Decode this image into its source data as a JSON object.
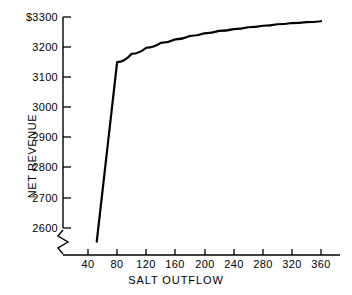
{
  "chart_data": {
    "type": "line",
    "title": "",
    "xlabel": "SALT OUTFLOW",
    "ylabel": "NET REVENUE",
    "xlim": [
      0,
      400
    ],
    "ylim": [
      2550,
      3320
    ],
    "grid": false,
    "legend": "none",
    "y_axis_break": true,
    "y_axis_break_note": "axis broken below 2600",
    "y_currency_prefix": "$",
    "xticks": [
      40,
      80,
      120,
      160,
      200,
      240,
      280,
      320,
      360
    ],
    "xtick_labels": [
      "40",
      "80",
      "120",
      "160",
      "200",
      "240",
      "280",
      "320",
      "360"
    ],
    "yticks": [
      2600,
      2700,
      2800,
      2900,
      3000,
      3100,
      3200,
      3300
    ],
    "ytick_labels": [
      "2600",
      "2700",
      "2800",
      "2900",
      "3000",
      "3100",
      "3200",
      "$3300"
    ],
    "series": [
      {
        "name": "net revenue vs salt outflow",
        "x": [
          52,
          80,
          100,
          120,
          140,
          160,
          180,
          200,
          220,
          240,
          260,
          280,
          300,
          320,
          340,
          360
        ],
        "values": [
          2555,
          3150,
          3178,
          3198,
          3214,
          3226,
          3237,
          3246,
          3254,
          3260,
          3266,
          3271,
          3276,
          3280,
          3283,
          3286
        ]
      }
    ],
    "annotations": []
  },
  "axis": {
    "y_title": "NET REVENUE",
    "x_title": "SALT OUTFLOW"
  }
}
